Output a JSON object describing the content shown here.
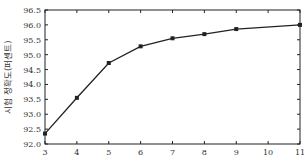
{
  "chart_data": {
    "type": "line",
    "title": "",
    "xlabel": "",
    "ylabel": "시험 정확도(퍼센트)",
    "xlim": [
      3,
      11
    ],
    "ylim": [
      92.0,
      96.5
    ],
    "x_ticks": [
      3,
      4,
      5,
      6,
      7,
      8,
      9,
      10,
      11
    ],
    "y_ticks": [
      "92.0",
      "92.5",
      "93.0",
      "93.5",
      "94.0",
      "94.5",
      "95.0",
      "95.5",
      "96.0",
      "96.5"
    ],
    "grid": false,
    "legend": null,
    "series": [
      {
        "name": "accuracy",
        "color": "#222222",
        "marker": "square",
        "x": [
          3,
          4,
          5,
          6,
          7,
          8,
          9,
          11
        ],
        "values": [
          92.35,
          93.55,
          94.72,
          95.28,
          95.55,
          95.69,
          95.86,
          96.0
        ]
      }
    ]
  }
}
